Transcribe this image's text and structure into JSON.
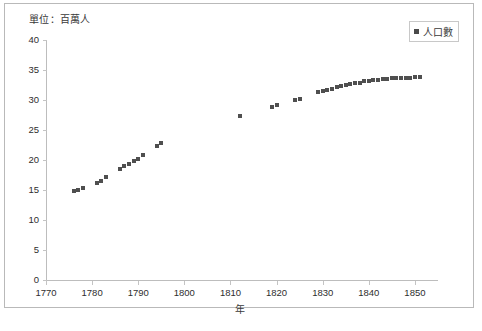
{
  "chart": {
    "unit_note": "單位：百萬人",
    "xlabel": "年",
    "legend_label": "人口數",
    "marker_color": "#4f4f4f",
    "frame_color": "#b9b9b9",
    "axis_color": "#bdbdbd"
  },
  "chart_data": {
    "type": "scatter",
    "title": "",
    "subtitle": "",
    "annotations": [
      "單位：百萬人"
    ],
    "xlabel": "年",
    "ylabel": "",
    "legend": [
      "人口數"
    ],
    "legend_position": "top-right",
    "grid": false,
    "xlim": [
      1770,
      1855
    ],
    "ylim": [
      0,
      40
    ],
    "xticks": [
      1770,
      1780,
      1790,
      1800,
      1810,
      1820,
      1830,
      1840,
      1850
    ],
    "yticks": [
      0,
      5,
      10,
      15,
      20,
      25,
      30,
      35,
      40
    ],
    "series": [
      {
        "name": "人口數",
        "x": [
          1776,
          1777,
          1778,
          1781,
          1782,
          1783,
          1786,
          1787,
          1788,
          1789,
          1790,
          1791,
          1794,
          1795,
          1812,
          1819,
          1820,
          1824,
          1825,
          1829,
          1830,
          1831,
          1832,
          1833,
          1834,
          1835,
          1836,
          1837,
          1838,
          1839,
          1840,
          1841,
          1842,
          1843,
          1844,
          1845,
          1846,
          1847,
          1848,
          1849,
          1850,
          1851
        ],
        "y": [
          14.9,
          15.0,
          15.4,
          16.1,
          16.5,
          17.1,
          18.5,
          19.0,
          19.4,
          19.8,
          20.2,
          20.8,
          22.3,
          22.9,
          27.4,
          28.8,
          29.1,
          30.0,
          30.2,
          31.3,
          31.5,
          31.7,
          31.9,
          32.1,
          32.3,
          32.5,
          32.6,
          32.8,
          32.9,
          33.1,
          33.2,
          33.3,
          33.4,
          33.5,
          33.5,
          33.6,
          33.6,
          33.7,
          33.7,
          33.7,
          33.8,
          33.8
        ]
      }
    ]
  }
}
